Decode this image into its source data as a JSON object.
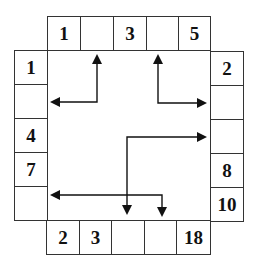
{
  "puzzle": {
    "top_row": [
      "1",
      "",
      "3",
      "",
      "5"
    ],
    "left_col": [
      "1",
      "",
      "4",
      "7",
      ""
    ],
    "right_col": [
      "2",
      "",
      "",
      "8",
      "10"
    ],
    "bottom_row": [
      "2",
      "3",
      "",
      "",
      "18"
    ]
  },
  "colors": {
    "line": "#111111",
    "border": "#333333",
    "background": "#ffffff"
  }
}
